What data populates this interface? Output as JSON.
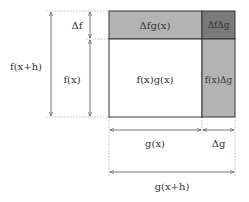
{
  "diagram": {
    "regions": {
      "main": {
        "label": "f(x)g(x)",
        "color": "#ffffff"
      },
      "top": {
        "label": "Δfg(x)",
        "color": "#b3b3b3"
      },
      "right": {
        "label": "f(x)Δg",
        "color": "#b3b3b3"
      },
      "corner": {
        "label": "fΔg",
        "label_full": "ΔfΔg",
        "color": "#7a7a7a"
      }
    },
    "vertical_dims": {
      "total": "f(x+h)",
      "delta": "Δf",
      "base": "f(x)"
    },
    "horizontal_dims": {
      "base": "g(x)",
      "delta": "Δg",
      "total": "g(x+h)"
    },
    "colors": {
      "stroke": "#333333",
      "dim_line": "#555555",
      "dotted": "#aaaaaa"
    }
  }
}
